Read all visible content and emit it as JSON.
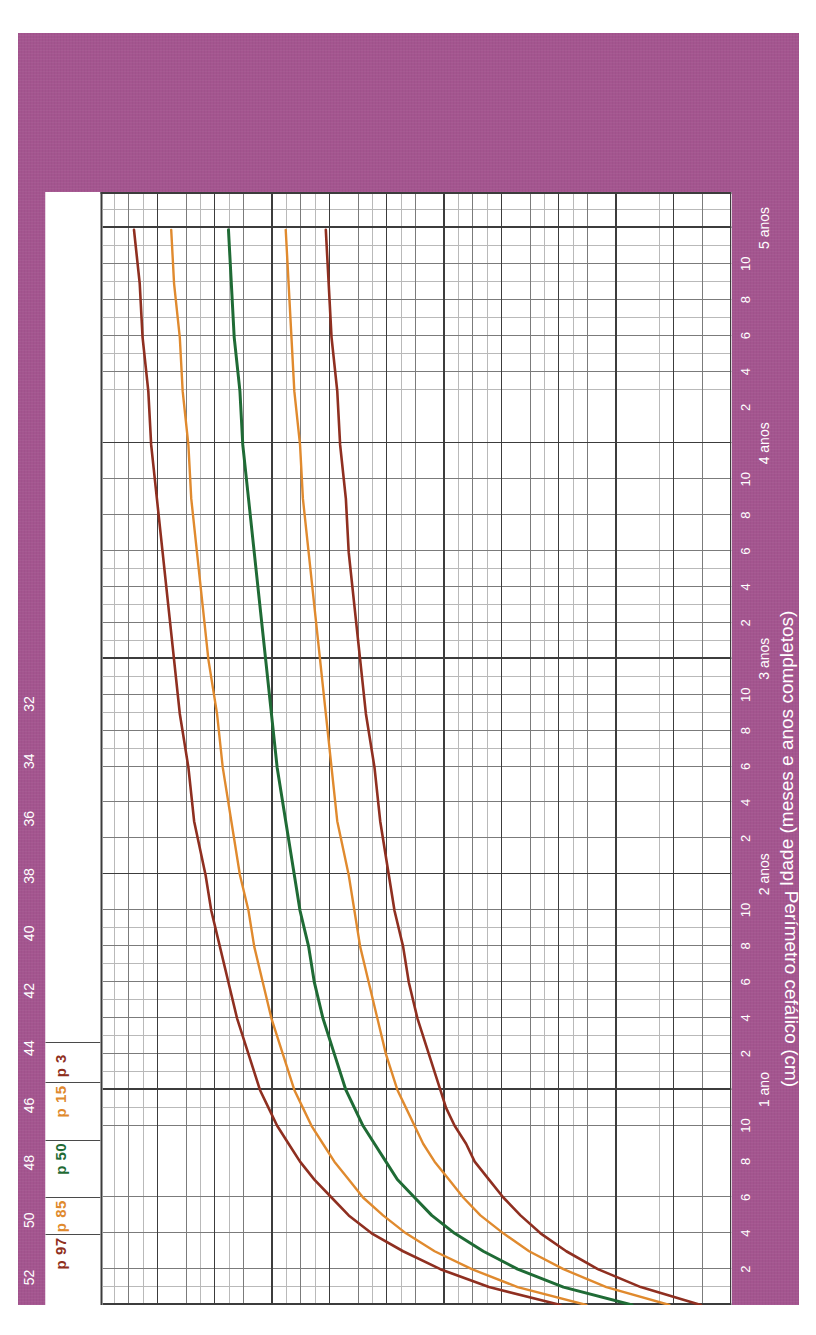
{
  "theme": {
    "card_bg": "#a4558f",
    "paper_bg": "#ffffff",
    "grid_major": "#3c3c3c",
    "grid_minor": "#b9b9b9",
    "tick_text": "#ffffff"
  },
  "chart_data": {
    "type": "line",
    "title": "",
    "xlabel": "Idade (meses e anos completos)",
    "ylabel": "Perímetro cefálico (cm)",
    "xlim": [
      0,
      62
    ],
    "ylim": [
      31,
      53
    ],
    "grid": true,
    "legend_position": "top-inside",
    "x_unit_label": "Meses",
    "x_origin_label": "Nascimento",
    "y_ticks": [
      52,
      50,
      48,
      46,
      44,
      42,
      40,
      38,
      36,
      34,
      32
    ],
    "x_month_ticks": [
      2,
      4,
      6,
      8,
      10
    ],
    "x_year_ticks": [
      {
        "months": 12,
        "label": "1 ano"
      },
      {
        "months": 24,
        "label": "2 anos"
      },
      {
        "months": 36,
        "label": "3 anos"
      },
      {
        "months": 48,
        "label": "4 anos"
      },
      {
        "months": 60,
        "label": "5 anos"
      }
    ],
    "x": [
      0,
      1,
      2,
      3,
      4,
      5,
      6,
      7,
      8,
      9,
      10,
      11,
      12,
      14,
      16,
      18,
      20,
      22,
      24,
      27,
      30,
      33,
      36,
      39,
      42,
      45,
      48,
      51,
      54,
      57,
      60
    ],
    "series": [
      {
        "name": "p 97",
        "label": "p 97",
        "color": "#8f2f20",
        "width": 2.6,
        "values": [
          37.0,
          39.5,
          41.2,
          42.5,
          43.6,
          44.4,
          45.0,
          45.6,
          46.1,
          46.5,
          46.9,
          47.2,
          47.5,
          47.9,
          48.3,
          48.6,
          48.9,
          49.2,
          49.4,
          49.8,
          50.0,
          50.3,
          50.5,
          50.7,
          50.9,
          51.1,
          51.3,
          51.4,
          51.6,
          51.7,
          51.9
        ]
      },
      {
        "name": "p 85",
        "label": "p 85",
        "color": "#e08a2e",
        "width": 2.4,
        "values": [
          36.1,
          38.5,
          40.1,
          41.4,
          42.4,
          43.2,
          43.9,
          44.4,
          44.9,
          45.3,
          45.7,
          46.0,
          46.3,
          46.7,
          47.1,
          47.4,
          47.7,
          47.9,
          48.2,
          48.5,
          48.8,
          49.0,
          49.3,
          49.5,
          49.7,
          49.9,
          50.0,
          50.2,
          50.3,
          50.5,
          50.6
        ]
      },
      {
        "name": "p 50",
        "label": "p 50",
        "color": "#1f6b35",
        "width": 3.0,
        "values": [
          34.5,
          36.9,
          38.5,
          39.7,
          40.7,
          41.5,
          42.1,
          42.7,
          43.1,
          43.5,
          43.9,
          44.2,
          44.5,
          44.9,
          45.3,
          45.6,
          45.8,
          46.1,
          46.3,
          46.6,
          46.9,
          47.1,
          47.3,
          47.5,
          47.7,
          47.9,
          48.1,
          48.2,
          48.4,
          48.5,
          48.6
        ]
      },
      {
        "name": "p 15",
        "label": "p 15",
        "color": "#e08a2e",
        "width": 2.4,
        "values": [
          33.2,
          35.4,
          36.9,
          38.1,
          39.0,
          39.8,
          40.4,
          40.9,
          41.4,
          41.8,
          42.1,
          42.4,
          42.7,
          43.1,
          43.4,
          43.7,
          44.0,
          44.2,
          44.4,
          44.8,
          45.0,
          45.2,
          45.4,
          45.6,
          45.8,
          46.0,
          46.1,
          46.3,
          46.4,
          46.5,
          46.6
        ]
      },
      {
        "name": "p 3",
        "label": "p 3",
        "color": "#8f2f20",
        "width": 2.6,
        "values": [
          32.1,
          34.2,
          35.7,
          36.8,
          37.7,
          38.4,
          39.0,
          39.5,
          40.0,
          40.3,
          40.7,
          41.0,
          41.2,
          41.6,
          42.0,
          42.3,
          42.5,
          42.8,
          43.0,
          43.3,
          43.5,
          43.8,
          44.0,
          44.2,
          44.4,
          44.5,
          44.7,
          44.8,
          45.0,
          45.1,
          45.2
        ]
      }
    ]
  }
}
